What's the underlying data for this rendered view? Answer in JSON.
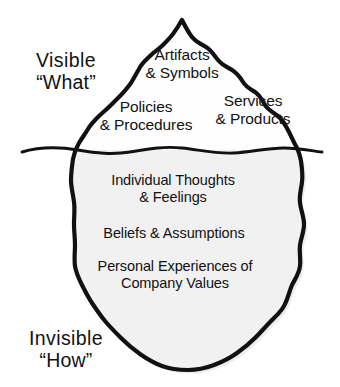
{
  "diagram": {
    "type": "iceberg",
    "colors": {
      "outline": "#111111",
      "fill_above_water": "#fefefe",
      "fill_below_water": "#f1f1f1",
      "waterline": "#111111",
      "text": "#121212",
      "background": "#ffffff"
    },
    "side_labels": {
      "visible": {
        "line1": "Visible",
        "line2": "“What”"
      },
      "invisible": {
        "line1": "Invisible",
        "line2": "“How”"
      }
    },
    "above_water": [
      {
        "id": "artifacts",
        "text": "Artifacts\n& Symbols"
      },
      {
        "id": "policies",
        "text": "Policies\n& Procedures"
      },
      {
        "id": "services",
        "text": "Services\n& Products"
      }
    ],
    "below_water": [
      {
        "id": "thoughts",
        "text": "Individual Thoughts\n& Feelings"
      },
      {
        "id": "beliefs",
        "text": "Beliefs & Assumptions"
      },
      {
        "id": "personal",
        "text": "Personal Experiences of\nCompany Values"
      }
    ]
  }
}
